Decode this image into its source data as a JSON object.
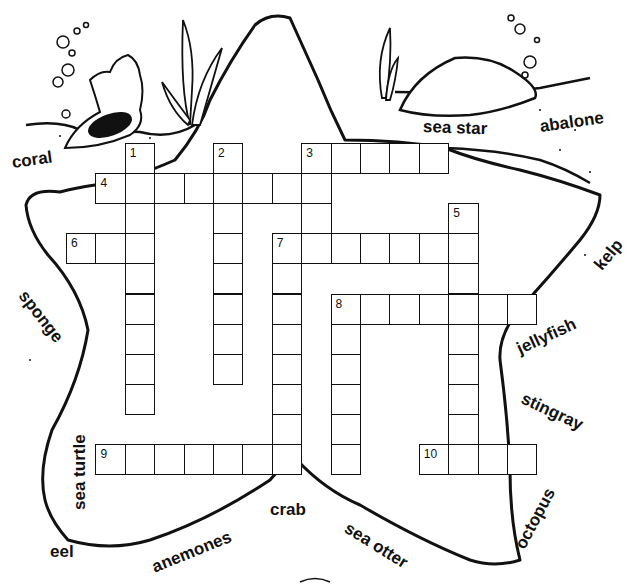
{
  "puzzle": {
    "title": "",
    "grid": {
      "origin_x": 66,
      "origin_y": 143,
      "cell_w": 29.4,
      "cell_h": 30.1
    },
    "entries": [
      {
        "number": 1,
        "direction": "down",
        "col": 2,
        "row": 0,
        "length": 9
      },
      {
        "number": 2,
        "direction": "down",
        "col": 5,
        "row": 0,
        "length": 8
      },
      {
        "number": 3,
        "direction": "across",
        "col": 8,
        "row": 0,
        "length": 5
      },
      {
        "number": 3,
        "direction": "down",
        "col": 8,
        "row": 0,
        "length": 4
      },
      {
        "number": 4,
        "direction": "across",
        "col": 1,
        "row": 1,
        "length": 8
      },
      {
        "number": 5,
        "direction": "down",
        "col": 13,
        "row": 2,
        "length": 9
      },
      {
        "number": 6,
        "direction": "across",
        "col": 0,
        "row": 3,
        "length": 3
      },
      {
        "number": 7,
        "direction": "across",
        "col": 7,
        "row": 3,
        "length": 7
      },
      {
        "number": 7,
        "direction": "down",
        "col": 7,
        "row": 3,
        "length": 8
      },
      {
        "number": 8,
        "direction": "across",
        "col": 9,
        "row": 5,
        "length": 7
      },
      {
        "number": 8,
        "direction": "down",
        "col": 9,
        "row": 5,
        "length": 6
      },
      {
        "number": 9,
        "direction": "across",
        "col": 1,
        "row": 10,
        "length": 7
      },
      {
        "number": 10,
        "direction": "across",
        "col": 12,
        "row": 10,
        "length": 4
      }
    ],
    "numbers": [
      {
        "label": "1",
        "col": 2,
        "row": 0
      },
      {
        "label": "2",
        "col": 5,
        "row": 0
      },
      {
        "label": "3",
        "col": 8,
        "row": 0
      },
      {
        "label": "4",
        "col": 1,
        "row": 1
      },
      {
        "label": "5",
        "col": 13,
        "row": 2
      },
      {
        "label": "6",
        "col": 0,
        "row": 3
      },
      {
        "label": "7",
        "col": 7,
        "row": 3
      },
      {
        "label": "8",
        "col": 9,
        "row": 5
      },
      {
        "label": "9",
        "col": 1,
        "row": 10
      },
      {
        "label": "10",
        "col": 12,
        "row": 10
      }
    ]
  },
  "word_bank": [
    {
      "word": "coral",
      "x": 12,
      "y": 163,
      "rotate": -8
    },
    {
      "word": "sea star",
      "x": 423,
      "y": 127,
      "rotate": 2
    },
    {
      "word": "abalone",
      "x": 540,
      "y": 127,
      "rotate": -8
    },
    {
      "word": "kelp",
      "x": 598,
      "y": 268,
      "rotate": -50
    },
    {
      "word": "sponge",
      "x": 22,
      "y": 293,
      "rotate": 52
    },
    {
      "word": "jellyfish",
      "x": 518,
      "y": 350,
      "rotate": -25
    },
    {
      "word": "stingray",
      "x": 522,
      "y": 398,
      "rotate": 25
    },
    {
      "word": "sea turtle",
      "x": 80,
      "y": 510,
      "rotate": -90
    },
    {
      "word": "eel",
      "x": 50,
      "y": 552,
      "rotate": 0
    },
    {
      "word": "anemones",
      "x": 153,
      "y": 568,
      "rotate": -22
    },
    {
      "word": "crab",
      "x": 270,
      "y": 510,
      "rotate": 0
    },
    {
      "word": "sea otter",
      "x": 346,
      "y": 527,
      "rotate": 32
    },
    {
      "word": "octopus",
      "x": 520,
      "y": 548,
      "rotate": -62
    }
  ],
  "colors": {
    "ink": "#111111",
    "paper": "#ffffff"
  }
}
